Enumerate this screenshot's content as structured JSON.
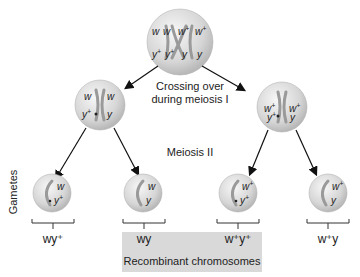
{
  "diagram": {
    "top_cell": {
      "genes_top": [
        "w",
        "w",
        "w+",
        "w+"
      ],
      "genes_bottom": [
        "y+",
        "y+",
        "y",
        "y"
      ]
    },
    "step_labels": {
      "crossing_over_line1": "Crossing over",
      "crossing_over_line2": "during meiosis I",
      "meiosis2": "Meiosis II",
      "gametes": "Gametes"
    },
    "meiosis1_cells": [
      {
        "top_left": "w",
        "top_right": "w",
        "bottom_left": "y+",
        "bottom_right": "y"
      },
      {
        "top_left": "w+",
        "top_right": "w+",
        "bottom_left": "y+",
        "bottom_right": "y"
      }
    ],
    "gametes": [
      {
        "top": "w",
        "bottom": "y+",
        "genotype": "wy⁺",
        "recombinant": false
      },
      {
        "top": "w",
        "bottom": "y",
        "genotype": "wy",
        "recombinant": true
      },
      {
        "top": "w+",
        "bottom": "y+",
        "genotype": "w⁺y⁺",
        "recombinant": true
      },
      {
        "top": "w+",
        "bottom": "y",
        "genotype": "w⁺y",
        "recombinant": false
      }
    ],
    "recombinant_label": "Recombinant chromosomes",
    "colors": {
      "cell_fill": "#d8d8d8",
      "cell_highlight": "#f4f4f4",
      "chromosome": "#9a9a9a",
      "arrow": "#111111",
      "recombinant_box": "#d9d9d9",
      "text": "#222222"
    }
  }
}
